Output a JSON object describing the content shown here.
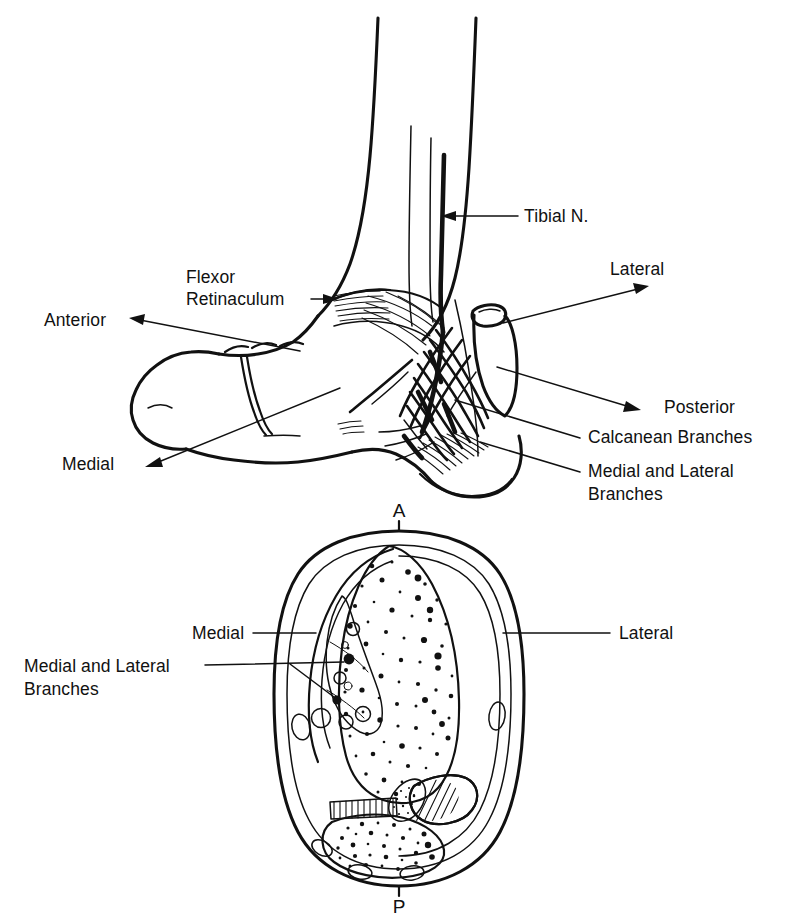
{
  "figure": {
    "background_color": "#ffffff",
    "ink_color": "#111111",
    "style": "line drawing / medical illustration"
  },
  "upper_panel": {
    "name": "lateral-view-of-ankle-and-foot",
    "labels": [
      {
        "id": "tibial-nerve",
        "text": "Tibial N.",
        "x": 524,
        "y": 222,
        "anchor": "start"
      },
      {
        "id": "lateral",
        "text": "Lateral",
        "x": 610,
        "y": 275,
        "anchor": "start"
      },
      {
        "id": "flexor-retinaculum-1",
        "text": "Flexor",
        "x": 186,
        "y": 283,
        "anchor": "start"
      },
      {
        "id": "flexor-retinaculum-2",
        "text": "Retinaculum",
        "x": 186,
        "y": 305,
        "anchor": "start"
      },
      {
        "id": "anterior",
        "text": "Anterior",
        "x": 44,
        "y": 326,
        "anchor": "start"
      },
      {
        "id": "posterior",
        "text": "Posterior",
        "x": 664,
        "y": 413,
        "anchor": "start"
      },
      {
        "id": "calcanean-branches",
        "text": "Calcanean Branches",
        "x": 588,
        "y": 443,
        "anchor": "start"
      },
      {
        "id": "medial-lateral-1",
        "text": "Medial and Lateral",
        "x": 588,
        "y": 477,
        "anchor": "start"
      },
      {
        "id": "medial-lateral-2",
        "text": "Branches",
        "x": 588,
        "y": 500,
        "anchor": "start"
      },
      {
        "id": "medial",
        "text": "Medial",
        "x": 62,
        "y": 470,
        "anchor": "start"
      }
    ]
  },
  "lower_panel": {
    "name": "cross-section-of-ankle",
    "orientation_markers": [
      {
        "id": "anterior-marker",
        "text": "A",
        "x": 399,
        "y": 517
      },
      {
        "id": "posterior-marker",
        "text": "P",
        "x": 399,
        "y": 906
      }
    ],
    "labels": [
      {
        "id": "medial-cs",
        "text": "Medial",
        "x": 192,
        "y": 639,
        "anchor": "start"
      },
      {
        "id": "lateral-cs",
        "text": "Lateral",
        "x": 619,
        "y": 639,
        "anchor": "start"
      },
      {
        "id": "medial-lateral-cs-1",
        "text": "Medial and Lateral",
        "x": 24,
        "y": 672,
        "anchor": "start"
      },
      {
        "id": "medial-lateral-cs-2",
        "text": "Branches",
        "x": 24,
        "y": 695,
        "anchor": "start"
      }
    ]
  }
}
